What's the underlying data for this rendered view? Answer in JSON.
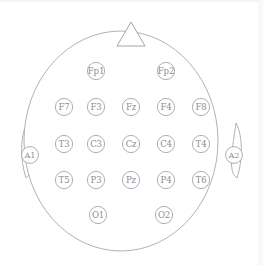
{
  "diagram": {
    "colors": {
      "background": "#ffffff",
      "outline_stroke": "#a9a9ad",
      "electrode_stroke": "#a6a6aa",
      "electrode_fill": "#ffffff",
      "label_text": "#8d8d92"
    },
    "head": {
      "center_x": 121,
      "center_y": 141,
      "radius_x": 97,
      "radius_y": 110
    },
    "nose": {
      "name": "nose-marker",
      "apex_x": 131,
      "apex_y": 22,
      "left_x": 117,
      "right_x": 145,
      "base_y": 46
    },
    "electrodes": [
      {
        "label": "Fp1",
        "x": 96,
        "y": 71,
        "region": "prefrontal-left",
        "row": 1
      },
      {
        "label": "Fp2",
        "x": 166,
        "y": 71,
        "region": "prefrontal-right",
        "row": 1
      },
      {
        "label": "F7",
        "x": 64,
        "y": 107,
        "region": "frontal-left-temporal",
        "row": 2
      },
      {
        "label": "F3",
        "x": 96,
        "y": 107,
        "region": "frontal-left",
        "row": 2
      },
      {
        "label": "Fz",
        "x": 131,
        "y": 107,
        "region": "frontal-midline",
        "row": 2
      },
      {
        "label": "F4",
        "x": 166,
        "y": 107,
        "region": "frontal-right",
        "row": 2
      },
      {
        "label": "F8",
        "x": 201,
        "y": 107,
        "region": "frontal-right-temporal",
        "row": 2
      },
      {
        "label": "T3",
        "x": 64,
        "y": 144,
        "region": "temporal-left",
        "row": 3
      },
      {
        "label": "C3",
        "x": 96,
        "y": 144,
        "region": "central-left",
        "row": 3
      },
      {
        "label": "Cz",
        "x": 131,
        "y": 144,
        "region": "central-midline",
        "row": 3
      },
      {
        "label": "C4",
        "x": 166,
        "y": 144,
        "region": "central-right",
        "row": 3
      },
      {
        "label": "T4",
        "x": 201,
        "y": 144,
        "region": "temporal-right",
        "row": 3
      },
      {
        "label": "T5",
        "x": 64,
        "y": 180,
        "region": "posterior-temporal-left",
        "row": 4
      },
      {
        "label": "P3",
        "x": 96,
        "y": 180,
        "region": "parietal-left",
        "row": 4
      },
      {
        "label": "Pz",
        "x": 131,
        "y": 180,
        "region": "parietal-midline",
        "row": 4
      },
      {
        "label": "P4",
        "x": 166,
        "y": 180,
        "region": "parietal-right",
        "row": 4
      },
      {
        "label": "T6",
        "x": 201,
        "y": 180,
        "region": "posterior-temporal-right",
        "row": 4
      },
      {
        "label": "O1",
        "x": 98,
        "y": 215,
        "region": "occipital-left",
        "row": 5
      },
      {
        "label": "O2",
        "x": 164,
        "y": 215,
        "region": "occipital-right",
        "row": 5
      }
    ],
    "electrode_radius": 8.6,
    "references": [
      {
        "label": "A1",
        "x": 30,
        "y": 155,
        "region": "left-ear-reference",
        "ear": "left"
      },
      {
        "label": "A2",
        "x": 234,
        "y": 155,
        "region": "right-ear-reference",
        "ear": "right"
      }
    ],
    "reference_radius": 8.4,
    "ears": [
      {
        "side": "left",
        "path": "M 27 123 C 20 136 20 160 26 178 C 36 172 30 146 27 123 Z"
      },
      {
        "side": "right",
        "path": "M 236 123 C 243 136 243 160 237 178 C 227 172 233 146 236 123 Z"
      }
    ]
  }
}
